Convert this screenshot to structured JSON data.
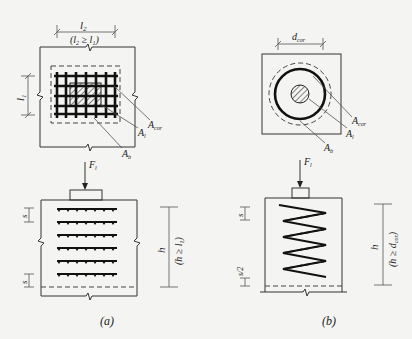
{
  "figure": {
    "panel_a": {
      "caption": "(a)",
      "plan_view": {
        "dim_top": "l2",
        "dim_top_note": "(l2 ≥ l1)",
        "dim_left": "l1",
        "leaders": [
          "Acor",
          "Al",
          "Ab"
        ]
      },
      "elevation": {
        "load": "Fl",
        "spacing_top": "s",
        "spacing_bottom": "s",
        "height": "h",
        "height_note": "(h ≥ l1)",
        "mesh_layers": 6
      }
    },
    "panel_b": {
      "caption": "(b)",
      "plan_view": {
        "dim_top": "dcor",
        "leaders": [
          "Acor",
          "Al",
          "Ab"
        ]
      },
      "elevation": {
        "load": "Fl",
        "spacing_top": "s",
        "spacing_bottom": "s/2",
        "height": "h",
        "height_note": "(h ≥ dcor)",
        "spiral_turns": 6
      }
    }
  },
  "labels": {
    "a_l2": "l",
    "a_l2_sub": "2",
    "a_note_open": "(l",
    "a_note_sub1": "2",
    "a_note_mid": " ≥ l",
    "a_note_sub2": "1",
    "a_note_close": ")",
    "a_l1": "l",
    "a_l1_sub": "1",
    "A": "A",
    "sub_cor": "cor",
    "sub_l": "l",
    "sub_b": "b",
    "F": "F",
    "F_sub": "l",
    "s": "s",
    "s_half": "s/2",
    "h": "h",
    "a_hnote": "(h ≥ l",
    "a_hnote_sub": "1",
    "a_hnote_close": ")",
    "b_hnote": "(h ≥ d",
    "b_hnote_sub": "cor",
    "b_hnote_close": ")",
    "d": "d",
    "d_sub": "cor",
    "cap_a": "(a)",
    "cap_b": "(b)"
  }
}
